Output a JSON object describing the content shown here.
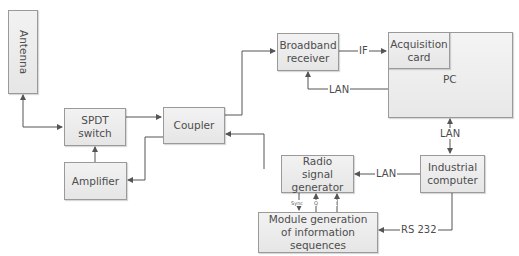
{
  "diagram": {
    "nodes": {
      "antenna": "Antenna",
      "spdt_switch": "SPDT switch",
      "coupler": "Coupler",
      "amplifier": "Amplifier",
      "broadband_receiver": "Broadband receiver",
      "acquisition_card": "Acquisition card",
      "pc": "PC",
      "industrial_computer": "Industrial computer",
      "radio_signal_generator": "Radio signal generator",
      "module_generation": "Module generation of information sequences"
    },
    "edge_labels": {
      "if": "IF",
      "lan_receiver": "LAN",
      "lan_pc_industrial": "LAN",
      "lan_industrial_generator": "LAN",
      "rs232": "RS 232",
      "sync": "Sync",
      "q": "Q",
      "i": "I"
    },
    "colors": {
      "box_fill": "#ebebeb",
      "box_border": "#9a9a9a",
      "line": "#555555",
      "text": "#4d4d4d"
    }
  }
}
